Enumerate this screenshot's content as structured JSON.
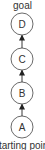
{
  "diagram": {
    "top_label": "goal",
    "bottom_label": "starting point",
    "nodes": [
      {
        "id": "D",
        "label": "D"
      },
      {
        "id": "C",
        "label": "C"
      },
      {
        "id": "B",
        "label": "B"
      },
      {
        "id": "A",
        "label": "A"
      }
    ],
    "edges": [
      {
        "from": "A",
        "to": "B"
      },
      {
        "from": "B",
        "to": "C"
      },
      {
        "from": "C",
        "to": "D"
      }
    ],
    "colors": {
      "stroke": "#444444",
      "text": "#333333",
      "background": "#ffffff"
    }
  }
}
